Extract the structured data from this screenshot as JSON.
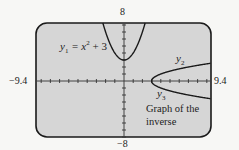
{
  "chart_data": {
    "type": "line",
    "title": "",
    "window": {
      "xmin": -9.4,
      "xmax": 9.4,
      "ymin": -8,
      "ymax": 8,
      "xscl": 1,
      "yscl": 1
    },
    "axis_labels": {
      "ymax": "8",
      "ymin": "-8",
      "xmin": "-9.4",
      "xmax": "9.4"
    },
    "series": [
      {
        "name": "y1",
        "label": "y1 = x^2 + 3",
        "expression": "x^2 + 3",
        "domain": "all real x"
      },
      {
        "name": "y2",
        "label": "y2",
        "expression": "sqrt(x - 3)",
        "domain": "x >= 3"
      },
      {
        "name": "y3",
        "label": "y3",
        "expression": "-sqrt(x - 3)",
        "domain": "x >= 3"
      }
    ],
    "annotations": [
      "Graph of the",
      "inverse"
    ],
    "grid": false,
    "colors": {
      "screen": "#d6d6d6",
      "frame": "#1a1a1a",
      "curve": "#1a1a1a",
      "background": "#f7f7f5"
    }
  },
  "labels": {
    "y1_prefix": "y",
    "y1_sub": "1",
    "y1_rest": " = x",
    "y1_sup": "2",
    "y1_tail": " + 3",
    "y2_main": "y",
    "y2_sub": "2",
    "y3_main": "y",
    "y3_sub": "3",
    "note_line1": "Graph of the",
    "note_line2": "inverse",
    "ymax": "8",
    "ymin": "−8",
    "xmin": "−9.4",
    "xmax": "9.4"
  }
}
